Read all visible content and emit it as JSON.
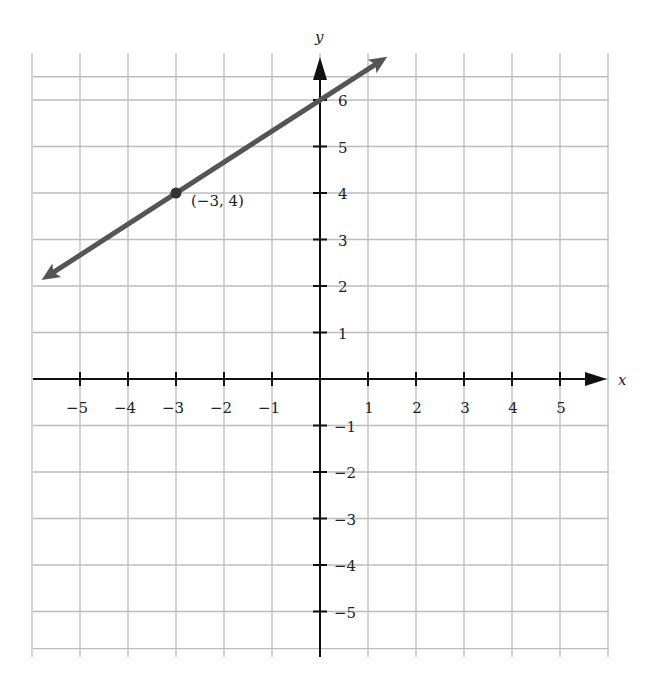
{
  "chart_data": {
    "type": "line",
    "title": "",
    "xlabel": "x",
    "ylabel": "y",
    "xlim": [
      -6,
      6
    ],
    "ylim": [
      -6,
      6.5
    ],
    "grid": true,
    "x_ticks": [
      "-5",
      "-4",
      "-3",
      "-2",
      "-1",
      "1",
      "2",
      "3",
      "4",
      "5"
    ],
    "y_ticks": [
      "6",
      "5",
      "4",
      "3",
      "2",
      "1",
      "-1",
      "-2",
      "-3",
      "-4",
      "-5"
    ],
    "series": [
      {
        "name": "line",
        "slope": 0.6667,
        "intercept": 6,
        "x": [
          -5.8,
          1.4
        ],
        "y": [
          2.13,
          6.93
        ],
        "arrows": "both"
      }
    ],
    "points": [
      {
        "x": -3,
        "y": 4,
        "label": "(−3, 4)"
      }
    ],
    "color": "#555555"
  },
  "labels": {
    "x_axis": "x",
    "y_axis": "y",
    "point_label": "(−3, 4)",
    "xticks": [
      {
        "v": -5,
        "t": "−5"
      },
      {
        "v": -4,
        "t": "−4"
      },
      {
        "v": -3,
        "t": "−3"
      },
      {
        "v": -2,
        "t": "−2"
      },
      {
        "v": -1,
        "t": "−1"
      },
      {
        "v": 1,
        "t": "1"
      },
      {
        "v": 2,
        "t": "2"
      },
      {
        "v": 3,
        "t": "3"
      },
      {
        "v": 4,
        "t": "4"
      },
      {
        "v": 5,
        "t": "5"
      }
    ],
    "yticks": [
      {
        "v": 6,
        "t": "6"
      },
      {
        "v": 5,
        "t": "5"
      },
      {
        "v": 4,
        "t": "4"
      },
      {
        "v": 3,
        "t": "3"
      },
      {
        "v": 2,
        "t": "2"
      },
      {
        "v": 1,
        "t": "1"
      },
      {
        "v": -1,
        "t": "−1"
      },
      {
        "v": -2,
        "t": "−2"
      },
      {
        "v": -3,
        "t": "−3"
      },
      {
        "v": -4,
        "t": "−4"
      },
      {
        "v": -5,
        "t": "−5"
      }
    ]
  }
}
